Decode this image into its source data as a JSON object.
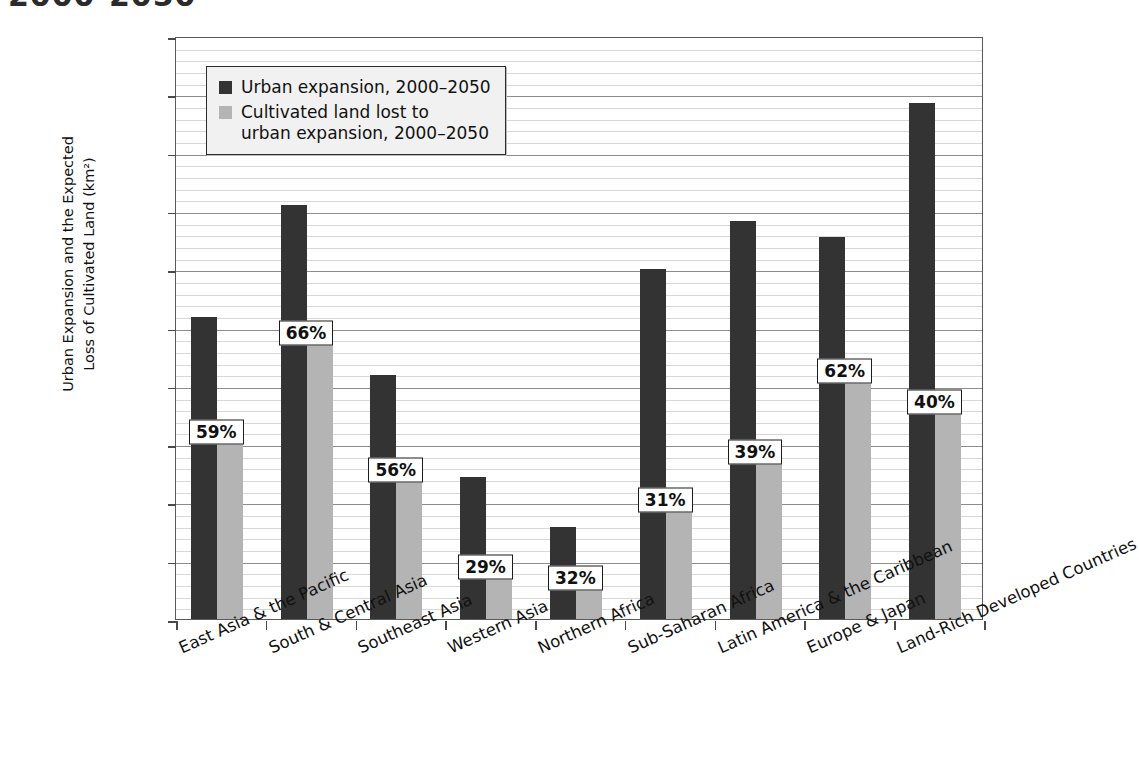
{
  "title_partial": "2000-2050",
  "chart_data": {
    "type": "bar",
    "title": "",
    "xlabel": "",
    "ylabel": "Urban Expansion and the Expected\nLoss of Cultivated Land (km²)",
    "ylim": [
      0,
      500000
    ],
    "ytick_step": 50000,
    "minor_gridline_step": 10000,
    "grid": true,
    "legend_position": "top-left-inside",
    "ytick_labels": [
      "0",
      "50,000",
      "100,000",
      "150,000",
      "200,000",
      "250,000",
      "300,000",
      "350,000",
      "400,000",
      "450,000",
      "500,000"
    ],
    "categories": [
      "East Asia & the Pacific",
      "South & Central Asia",
      "Southeast Asia",
      "Western Asia",
      "Northern Africa",
      "Sub-Saharan Africa",
      "Latin America & the Caribbean",
      "Europe & Japan",
      "Land-Rich Developed Countries"
    ],
    "series": [
      {
        "name": "Urban expansion, 2000–2050",
        "color": "#333333",
        "values": [
          259000,
          355000,
          209000,
          122000,
          79000,
          300000,
          341000,
          328000,
          443000
        ]
      },
      {
        "name": "Cultivated land lost to\nurban expansion, 2000–2050",
        "color": "#b4b4b4",
        "values": [
          151000,
          236000,
          118000,
          35000,
          26000,
          93000,
          134000,
          203000,
          177000
        ]
      }
    ],
    "annotations": [
      {
        "category": "East Asia & the Pacific",
        "label": "59%"
      },
      {
        "category": "South & Central Asia",
        "label": "66%"
      },
      {
        "category": "Southeast Asia",
        "label": "56%"
      },
      {
        "category": "Western Asia",
        "label": "29%"
      },
      {
        "category": "Northern Africa",
        "label": "32%"
      },
      {
        "category": "Sub-Saharan Africa",
        "label": "31%"
      },
      {
        "category": "Latin America & the Caribbean",
        "label": "39%"
      },
      {
        "category": "Europe & Japan",
        "label": "62%"
      },
      {
        "category": "Land-Rich Developed Countries",
        "label": "40%"
      }
    ]
  },
  "legend": {
    "items": [
      {
        "label": "Urban expansion, 2000–2050",
        "color": "#333333"
      },
      {
        "label": "Cultivated land lost to\nurban expansion, 2000–2050",
        "color": "#b4b4b4"
      }
    ]
  }
}
